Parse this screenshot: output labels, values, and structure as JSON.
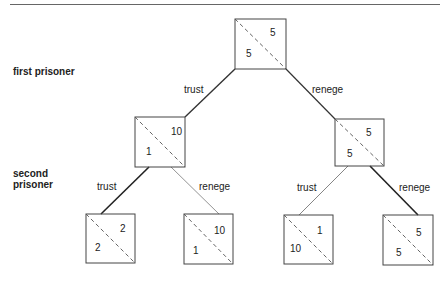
{
  "diagram": {
    "type": "game-tree",
    "players": {
      "first": "first prisoner",
      "second_line1": "second",
      "second_line2": "prisoner"
    },
    "root": {
      "upper_right": "5",
      "lower_left": "5"
    },
    "branches": {
      "root_left": "trust",
      "root_right": "renege",
      "left_left": "trust",
      "left_right": "renege",
      "right_left": "trust",
      "right_right": "renege"
    },
    "mid_left": {
      "upper_right": "10",
      "lower_left": "1"
    },
    "mid_right": {
      "upper_right": "5",
      "lower_left": "5"
    },
    "leaves": [
      {
        "upper_right": "2",
        "lower_left": "2"
      },
      {
        "upper_right": "10",
        "lower_left": "1"
      },
      {
        "upper_right": "1",
        "lower_left": "10"
      },
      {
        "upper_right": "5",
        "lower_left": "5"
      }
    ]
  }
}
